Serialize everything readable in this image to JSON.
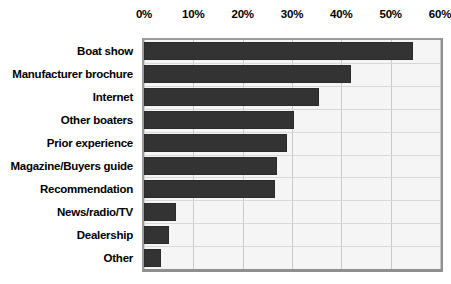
{
  "chart_data": {
    "type": "bar",
    "orientation": "horizontal",
    "title": "",
    "subtitle": "",
    "xlabel": "",
    "ylabel": "",
    "xlim": [
      0,
      60
    ],
    "xtick_labels": [
      "0%",
      "10%",
      "20%",
      "30%",
      "40%",
      "50%",
      "60%"
    ],
    "xticks": [
      0,
      10,
      20,
      30,
      40,
      50,
      60
    ],
    "grid": "vertical-and-horizontal",
    "legend": "none",
    "bar_color": "#333333",
    "plot_background": "#f5f5f5",
    "gridline_color": "#c9c9c9",
    "categories": [
      "Boat show",
      "Manufacturer brochure",
      "Internet",
      "Other boaters",
      "Prior experience",
      "Magazine/Buyers guide",
      "Recommendation",
      "News/radio/TV",
      "Dealership",
      "Other"
    ],
    "values": [
      54.5,
      42,
      35.5,
      30.5,
      29,
      27,
      26.5,
      6.5,
      5,
      3.5
    ],
    "value_unit": "%"
  }
}
